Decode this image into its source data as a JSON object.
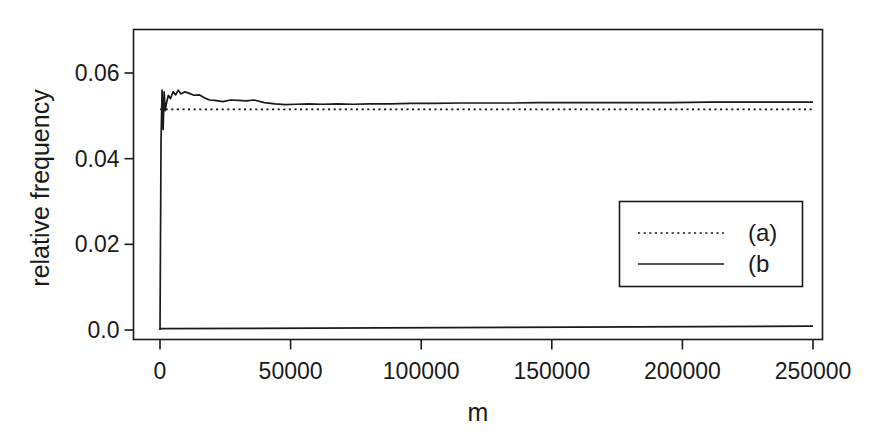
{
  "chart_data": {
    "type": "line",
    "title": "",
    "xlabel": "m",
    "ylabel": "relative frequency",
    "xlim": [
      -8000,
      258000
    ],
    "ylim": [
      0.0,
      0.0665
    ],
    "grid": false,
    "xticks": [
      0,
      50000,
      100000,
      150000,
      200000,
      250000
    ],
    "xtick_labels": [
      "0",
      "50000",
      "100000",
      "150000",
      "200000",
      "250000"
    ],
    "yticks": [
      0.0,
      0.02,
      0.04,
      0.06
    ],
    "ytick_labels": [
      "0.0",
      "0.02",
      "0.04",
      "0.06"
    ],
    "legend": {
      "position": "bottom-right",
      "entries": [
        {
          "label": "(a)",
          "style": "dotted"
        },
        {
          "label": "(b",
          "style": "solid"
        }
      ]
    },
    "series": [
      {
        "name": "(a)",
        "style": "dotted",
        "description": "Horizontal reference level, constant relative frequency",
        "x": [
          0,
          250000
        ],
        "values": [
          0.0515,
          0.0515
        ]
      },
      {
        "name": "(b)",
        "style": "solid",
        "description": "Running relative frequency estimate; rises sharply from 0, oscillates, converges to ~0.053",
        "x": [
          0,
          400,
          800,
          1200,
          1600,
          2000,
          2600,
          3200,
          4000,
          5000,
          6000,
          7000,
          8000,
          9500,
          11000,
          13000,
          15000,
          17000,
          19000,
          21000,
          24000,
          27000,
          30000,
          33000,
          36000,
          40000,
          44000,
          48000,
          52000,
          57000,
          62000,
          68000,
          74000,
          80000,
          88000,
          96000,
          105000,
          115000,
          125000,
          135000,
          145000,
          157000,
          170000,
          183000,
          196000,
          210000,
          225000,
          240000,
          250000
        ],
        "values": [
          0.0,
          0.0442,
          0.056,
          0.0468,
          0.0556,
          0.0512,
          0.0533,
          0.0548,
          0.054,
          0.0556,
          0.0549,
          0.056,
          0.0551,
          0.0556,
          0.0553,
          0.0548,
          0.0549,
          0.0542,
          0.0537,
          0.0536,
          0.0533,
          0.0537,
          0.0536,
          0.0535,
          0.0537,
          0.0531,
          0.0528,
          0.0526,
          0.0527,
          0.0528,
          0.0527,
          0.0528,
          0.0527,
          0.0528,
          0.0528,
          0.0529,
          0.0529,
          0.053,
          0.053,
          0.053,
          0.0531,
          0.0531,
          0.0531,
          0.0531,
          0.0531,
          0.0532,
          0.0532,
          0.0532,
          0.0532
        ]
      },
      {
        "name": "(b)-lower",
        "style": "solid",
        "description": "Lower near-zero branch of the solid curve",
        "x": [
          0,
          250000
        ],
        "values": [
          0.0003,
          0.0009
        ]
      }
    ]
  },
  "axes": {
    "x_title": "m",
    "y_title": "relative frequency"
  },
  "colors": {
    "background": "#ffffff",
    "foreground": "#1a1a1a",
    "axis": "#1a1a1a"
  }
}
